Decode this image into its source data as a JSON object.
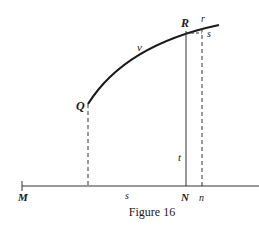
{
  "figure": {
    "caption": "Figure 16",
    "labels": {
      "Q": "Q",
      "R": "R",
      "r": "r",
      "s_small": "s",
      "v": "v",
      "t": "t",
      "M": "M",
      "s_base": "s",
      "N": "N",
      "n": "n"
    },
    "colors": {
      "ink": "#1a1a1a",
      "background": "#ffffff"
    }
  }
}
